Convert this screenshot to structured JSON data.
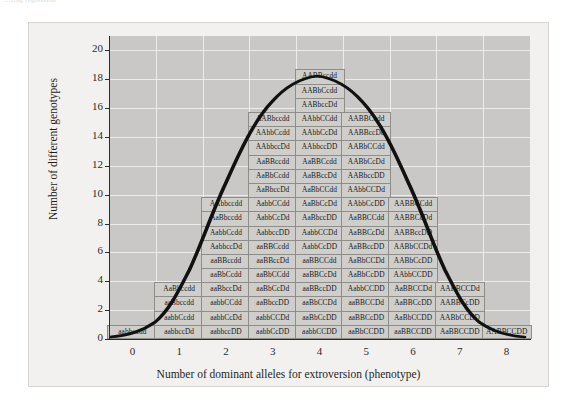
{
  "clipped_top_text": "…ring regression",
  "figure": {
    "background_color": "#f2f1ef",
    "plot_background_color": "#c9c8c6",
    "box_fill_color": "#cfcecb",
    "box_border_color": "#8e8d8a",
    "axis_color": "#2c2c2c",
    "grid_color": "#ececea"
  },
  "chart_data": {
    "type": "bar",
    "title": "",
    "subtitle": "",
    "xlabel": "Number of dominant alleles for extroversion (phenotype)",
    "ylabel": "Number of different genotypes",
    "categories": [
      "0",
      "1",
      "2",
      "3",
      "4",
      "5",
      "6",
      "7",
      "8"
    ],
    "values": [
      1,
      4,
      10,
      16,
      19,
      16,
      10,
      4,
      1
    ],
    "xlim": [
      -0.5,
      8.5
    ],
    "ylim": [
      0,
      21
    ],
    "yticks": [
      0,
      2,
      4,
      6,
      8,
      10,
      12,
      14,
      16,
      18,
      20
    ],
    "xticks": [
      0,
      1,
      2,
      3,
      4,
      5,
      6,
      7,
      8
    ],
    "grid": true,
    "legend": null,
    "annotations": [
      "Bell-shaped normal distribution curve overlaid on the stacked genotype boxes"
    ],
    "columns": [
      {
        "x": "0",
        "count": 1,
        "genotypes": [
          "aabbccdd"
        ]
      },
      {
        "x": "1",
        "count": 4,
        "genotypes": [
          "AaBbccdd",
          "aaBbccdd",
          "aabbCcdd",
          "aabbccDd"
        ]
      },
      {
        "x": "2",
        "count": 10,
        "genotypes": [
          "AAbbccdd",
          "AaBbccdd",
          "AabbCcdd",
          "AabbccDd",
          "aaBBccdd",
          "aaBbCcdd",
          "aaBbccDd",
          "aabbCCdd",
          "aabbCcDd",
          "aabbccDD"
        ]
      },
      {
        "x": "3",
        "count": 16,
        "genotypes": [
          "AABbccdd",
          "AAbbCcdd",
          "AAbbccDd",
          "AaBBccdd",
          "AaBbCcdd",
          "AaBbccDd",
          "AabbCCdd",
          "AabbCcDd",
          "AabbccDD",
          "aaBBCcdd",
          "aaBBccDd",
          "aaBbCCdd",
          "aaBbCcDd",
          "aaBbccDD",
          "aabbCCDd",
          "aabbCcDD"
        ]
      },
      {
        "x": "4",
        "count": 19,
        "genotypes": [
          "AABBccdd",
          "AABbCcdd",
          "AABbccDd",
          "AAbbCCdd",
          "AAbbCcDd",
          "AAbbccDD",
          "AaBBCcdd",
          "AaBBccDd",
          "AaBbCCdd",
          "AaBbCcDd",
          "AaBbccDD",
          "AabbCCDd",
          "AabbCcDD",
          "aaBBCCdd",
          "aaBBCcDd",
          "aaBBccDD",
          "aaBbCCDd",
          "aaBbCcDD",
          "aabbCCDD"
        ]
      },
      {
        "x": "5",
        "count": 16,
        "genotypes": [
          "AABBCcdd",
          "AABBccDd",
          "AABbCCdd",
          "AABbCcDd",
          "AABbccDD",
          "AAbbCCDd",
          "AAbbCcDD",
          "AaBBCCdd",
          "AaBBCcDd",
          "AaBBccDD",
          "AaBbCCDd",
          "AaBbCcDD",
          "AabbCCDD",
          "aaBBCCDd",
          "aaBBCcDD",
          "aaBbCCDD"
        ]
      },
      {
        "x": "6",
        "count": 10,
        "genotypes": [
          "AABBCCdd",
          "AABBCcDd",
          "AABBccDD",
          "AABbCCDd",
          "AABbCcDD",
          "AAbbCCDD",
          "AaBBCCDd",
          "AaBBCcDD",
          "AaBbCCDD",
          "aaBBCCDD"
        ]
      },
      {
        "x": "7",
        "count": 4,
        "genotypes": [
          "AABBCCDd",
          "AABBCcDD",
          "AABbCCDD",
          "AaBBCCDD"
        ]
      },
      {
        "x": "8",
        "count": 1,
        "genotypes": [
          "AABBCCDD"
        ]
      }
    ]
  }
}
